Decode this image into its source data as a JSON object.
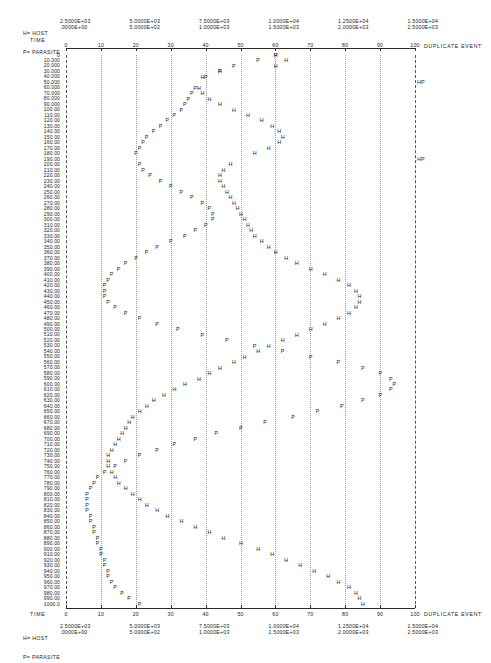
{
  "legend": {
    "host_line": "H= HOST",
    "parasite_line": "P= PARASITE"
  },
  "axis": {
    "time_label": "TIME",
    "duplicate_event_label": "DUPLICATE EVENT",
    "ticks": [
      "0",
      "10",
      "20",
      "30",
      "40",
      "50",
      "60",
      "70",
      "80",
      "90",
      "100"
    ]
  },
  "scale_columns": [
    {
      "host": "2.5000E+03",
      "parasite": ".0000E+00"
    },
    {
      "host": "5.0000E+03",
      "parasite": "5.0000E+02"
    },
    {
      "host": "7.5000E+03",
      "parasite": "1.0000E+03"
    },
    {
      "host": "1.0000E+04",
      "parasite": "1.5000E+03"
    },
    {
      "host": "1.2500E+04",
      "parasite": "2.0000E+03"
    },
    {
      "host": "1.5000E+04",
      "parasite": "2.5000E+03"
    }
  ],
  "y_axis": {
    "labels": [
      "0",
      "10.000",
      "20.000",
      "30.000",
      "40.000",
      "50.000",
      "60.000",
      "70.000",
      "80.000",
      "90.000",
      "100.00",
      "110.00",
      "120.00",
      "130.00",
      "140.00",
      "150.00",
      "160.00",
      "170.00",
      "180.00",
      "190.00",
      "200.00",
      "210.00",
      "220.00",
      "230.00",
      "240.00",
      "250.00",
      "260.00",
      "270.00",
      "280.00",
      "290.00",
      "300.00",
      "310.00",
      "320.00",
      "330.00",
      "340.00",
      "350.00",
      "360.00",
      "370.00",
      "380.00",
      "390.00",
      "400.00",
      "410.00",
      "420.00",
      "430.00",
      "440.00",
      "450.00",
      "460.00",
      "470.00",
      "480.00",
      "490.00",
      "500.00",
      "510.00",
      "520.00",
      "530.00",
      "540.00",
      "550.00",
      "560.00",
      "570.00",
      "580.00",
      "590.00",
      "600.00",
      "610.00",
      "620.00",
      "630.00",
      "640.00",
      "650.00",
      "660.00",
      "670.00",
      "680.00",
      "690.00",
      "700.00",
      "710.00",
      "720.00",
      "730.00",
      "740.00",
      "750.00",
      "760.00",
      "770.00",
      "780.00",
      "790.00",
      "800.00",
      "810.00",
      "820.00",
      "830.00",
      "840.00",
      "850.00",
      "860.00",
      "870.00",
      "880.00",
      "890.00",
      "900.00",
      "910.00",
      "920.00",
      "930.00",
      "940.00",
      "950.00",
      "960.00",
      "970.00",
      "980.00",
      "990.00",
      "1000.0"
    ]
  },
  "chart_data": {
    "type": "scatter",
    "title": "",
    "xlabel": "TIME",
    "ylabel": "",
    "xlim": [
      0,
      100
    ],
    "ylim": [
      0,
      1000
    ],
    "grid": true,
    "legend_position": "top-left",
    "orientation": "vertical-time-downward",
    "marker_glyphs": {
      "host": "H",
      "parasite": "P"
    },
    "series": [
      {
        "name": "HOST",
        "glyph": "H",
        "points": [
          [
            0,
            60
          ],
          [
            10,
            63
          ],
          [
            20,
            60
          ],
          [
            30,
            44
          ],
          [
            40,
            39
          ],
          [
            50,
            38
          ],
          [
            60,
            38
          ],
          [
            70,
            39
          ],
          [
            80,
            41
          ],
          [
            90,
            44
          ],
          [
            100,
            48
          ],
          [
            110,
            52
          ],
          [
            120,
            56
          ],
          [
            130,
            59
          ],
          [
            140,
            61
          ],
          [
            150,
            62
          ],
          [
            160,
            61
          ],
          [
            170,
            58
          ],
          [
            180,
            54
          ],
          [
            190,
            50
          ],
          [
            200,
            47
          ],
          [
            210,
            45
          ],
          [
            220,
            44
          ],
          [
            230,
            44
          ],
          [
            240,
            45
          ],
          [
            250,
            46
          ],
          [
            260,
            47
          ],
          [
            270,
            48
          ],
          [
            280,
            49
          ],
          [
            290,
            50
          ],
          [
            300,
            51
          ],
          [
            310,
            52
          ],
          [
            320,
            53
          ],
          [
            330,
            54
          ],
          [
            340,
            56
          ],
          [
            350,
            58
          ],
          [
            360,
            60
          ],
          [
            370,
            63
          ],
          [
            380,
            66
          ],
          [
            390,
            70
          ],
          [
            400,
            74
          ],
          [
            410,
            78
          ],
          [
            420,
            81
          ],
          [
            430,
            83
          ],
          [
            440,
            84
          ],
          [
            450,
            84
          ],
          [
            460,
            83
          ],
          [
            470,
            81
          ],
          [
            480,
            78
          ],
          [
            490,
            74
          ],
          [
            500,
            70
          ],
          [
            510,
            66
          ],
          [
            520,
            62
          ],
          [
            530,
            58
          ],
          [
            540,
            55
          ],
          [
            550,
            51
          ],
          [
            560,
            48
          ],
          [
            570,
            44
          ],
          [
            580,
            41
          ],
          [
            590,
            38
          ],
          [
            600,
            34
          ],
          [
            610,
            31
          ],
          [
            620,
            28
          ],
          [
            630,
            25
          ],
          [
            640,
            23
          ],
          [
            650,
            21
          ],
          [
            660,
            19
          ],
          [
            670,
            18
          ],
          [
            680,
            17
          ],
          [
            690,
            16
          ],
          [
            700,
            15
          ],
          [
            710,
            14
          ],
          [
            720,
            13
          ],
          [
            730,
            12
          ],
          [
            740,
            12
          ],
          [
            750,
            12
          ],
          [
            760,
            13
          ],
          [
            770,
            14
          ],
          [
            780,
            15
          ],
          [
            790,
            17
          ],
          [
            800,
            19
          ],
          [
            810,
            21
          ],
          [
            820,
            23
          ],
          [
            830,
            26
          ],
          [
            840,
            29
          ],
          [
            850,
            33
          ],
          [
            860,
            37
          ],
          [
            870,
            41
          ],
          [
            880,
            45
          ],
          [
            890,
            50
          ],
          [
            900,
            55
          ],
          [
            910,
            59
          ],
          [
            920,
            63
          ],
          [
            930,
            67
          ],
          [
            940,
            71
          ],
          [
            950,
            75
          ],
          [
            960,
            78
          ],
          [
            970,
            81
          ],
          [
            980,
            83
          ],
          [
            990,
            84
          ],
          [
            1000,
            85
          ]
        ]
      },
      {
        "name": "PARASITE",
        "glyph": "P",
        "points": [
          [
            0,
            60
          ],
          [
            10,
            55
          ],
          [
            20,
            48
          ],
          [
            30,
            44
          ],
          [
            40,
            40
          ],
          [
            50,
            100
          ],
          [
            60,
            37
          ],
          [
            70,
            36
          ],
          [
            80,
            35
          ],
          [
            90,
            34
          ],
          [
            100,
            33
          ],
          [
            110,
            31
          ],
          [
            120,
            29
          ],
          [
            130,
            27
          ],
          [
            140,
            25
          ],
          [
            150,
            23
          ],
          [
            160,
            22
          ],
          [
            170,
            21
          ],
          [
            180,
            20
          ],
          [
            190,
            100
          ],
          [
            200,
            21
          ],
          [
            210,
            22
          ],
          [
            220,
            24
          ],
          [
            230,
            27
          ],
          [
            240,
            30
          ],
          [
            250,
            33
          ],
          [
            260,
            36
          ],
          [
            270,
            39
          ],
          [
            280,
            41
          ],
          [
            290,
            42
          ],
          [
            300,
            42
          ],
          [
            310,
            40
          ],
          [
            320,
            37
          ],
          [
            330,
            34
          ],
          [
            340,
            30
          ],
          [
            350,
            26
          ],
          [
            360,
            23
          ],
          [
            370,
            20
          ],
          [
            380,
            17
          ],
          [
            390,
            15
          ],
          [
            400,
            13
          ],
          [
            410,
            12
          ],
          [
            420,
            11
          ],
          [
            430,
            11
          ],
          [
            440,
            11
          ],
          [
            450,
            12
          ],
          [
            460,
            14
          ],
          [
            470,
            17
          ],
          [
            480,
            21
          ],
          [
            490,
            26
          ],
          [
            500,
            32
          ],
          [
            510,
            39
          ],
          [
            520,
            46
          ],
          [
            530,
            54
          ],
          [
            540,
            62
          ],
          [
            550,
            70
          ],
          [
            560,
            78
          ],
          [
            570,
            85
          ],
          [
            580,
            90
          ],
          [
            590,
            93
          ],
          [
            600,
            94
          ],
          [
            610,
            93
          ],
          [
            620,
            90
          ],
          [
            630,
            85
          ],
          [
            640,
            79
          ],
          [
            650,
            72
          ],
          [
            660,
            65
          ],
          [
            670,
            57
          ],
          [
            680,
            50
          ],
          [
            690,
            43
          ],
          [
            700,
            37
          ],
          [
            710,
            31
          ],
          [
            720,
            26
          ],
          [
            730,
            21
          ],
          [
            740,
            17
          ],
          [
            750,
            14
          ],
          [
            760,
            11
          ],
          [
            770,
            9
          ],
          [
            780,
            8
          ],
          [
            790,
            7
          ],
          [
            800,
            6
          ],
          [
            810,
            6
          ],
          [
            820,
            6
          ],
          [
            830,
            6
          ],
          [
            840,
            7
          ],
          [
            850,
            7
          ],
          [
            860,
            8
          ],
          [
            870,
            8
          ],
          [
            880,
            9
          ],
          [
            890,
            9
          ],
          [
            900,
            10
          ],
          [
            910,
            10
          ],
          [
            920,
            11
          ],
          [
            930,
            11
          ],
          [
            940,
            12
          ],
          [
            950,
            12
          ],
          [
            960,
            13
          ],
          [
            970,
            14
          ],
          [
            980,
            16
          ],
          [
            990,
            18
          ],
          [
            1000,
            21
          ]
        ]
      }
    ]
  }
}
